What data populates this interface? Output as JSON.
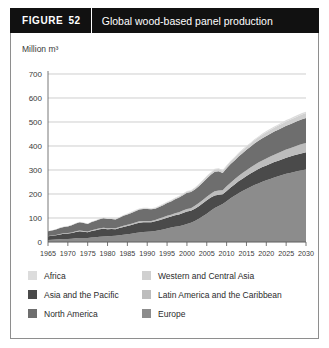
{
  "header": {
    "figure_label": "FIGURE",
    "figure_number": "52",
    "title": "Global wood-based panel production"
  },
  "chart_data": {
    "type": "area",
    "stacked": true,
    "title": "Global wood-based panel production",
    "xlabel": "",
    "ylabel": "Million m³",
    "unit_label": "Million m³",
    "xlim": [
      1965,
      2030
    ],
    "ylim": [
      0,
      700
    ],
    "yticks": [
      0,
      100,
      200,
      300,
      400,
      500,
      600,
      700
    ],
    "xticks": [
      1965,
      1970,
      1975,
      1980,
      1985,
      1990,
      1995,
      2000,
      2005,
      2010,
      2015,
      2020,
      2025,
      2030
    ],
    "grid": true,
    "legend_position": "bottom",
    "x": [
      1965,
      1966,
      1967,
      1968,
      1969,
      1970,
      1971,
      1972,
      1973,
      1974,
      1975,
      1976,
      1977,
      1978,
      1979,
      1980,
      1981,
      1982,
      1983,
      1984,
      1985,
      1986,
      1987,
      1988,
      1989,
      1990,
      1991,
      1992,
      1993,
      1994,
      1995,
      1996,
      1997,
      1998,
      1999,
      2000,
      2001,
      2002,
      2003,
      2004,
      2005,
      2006,
      2007,
      2008,
      2009,
      2010,
      2011,
      2012,
      2013,
      2014,
      2015,
      2016,
      2017,
      2018,
      2019,
      2020,
      2021,
      2022,
      2023,
      2024,
      2025,
      2026,
      2027,
      2028,
      2029,
      2030
    ],
    "series": [
      {
        "name": "Asia and the Pacific",
        "color": "#8c8c8c",
        "values": [
          8,
          9,
          10,
          11,
          12,
          13,
          14,
          16,
          17,
          17,
          17,
          19,
          20,
          22,
          23,
          24,
          25,
          26,
          28,
          30,
          32,
          34,
          37,
          40,
          42,
          43,
          44,
          46,
          49,
          52,
          56,
          60,
          64,
          66,
          70,
          75,
          80,
          88,
          97,
          107,
          118,
          130,
          142,
          150,
          158,
          170,
          182,
          193,
          203,
          212,
          221,
          229,
          237,
          244,
          251,
          257,
          263,
          269,
          274,
          279,
          284,
          288,
          292,
          296,
          299,
          302
        ]
      },
      {
        "name": "North America",
        "color": "#4a4a4a",
        "values": [
          16,
          17,
          18,
          20,
          22,
          22,
          24,
          26,
          28,
          26,
          24,
          27,
          29,
          31,
          32,
          29,
          29,
          27,
          30,
          33,
          35,
          37,
          39,
          40,
          40,
          39,
          38,
          40,
          42,
          44,
          45,
          46,
          47,
          49,
          51,
          52,
          50,
          51,
          52,
          54,
          56,
          55,
          52,
          47,
          41,
          43,
          45,
          47,
          50,
          52,
          54,
          56,
          58,
          60,
          61,
          62,
          63,
          64,
          65,
          66,
          67,
          68,
          69,
          70,
          71,
          72
        ]
      },
      {
        "name": "Latin America and the Caribbean",
        "color": "#bdbdbd",
        "values": [
          1,
          1,
          1,
          2,
          2,
          2,
          2,
          3,
          3,
          3,
          3,
          3,
          4,
          4,
          4,
          4,
          4,
          4,
          4,
          5,
          5,
          5,
          5,
          6,
          6,
          6,
          6,
          6,
          7,
          7,
          8,
          8,
          9,
          9,
          10,
          11,
          11,
          12,
          13,
          14,
          15,
          16,
          17,
          18,
          17,
          19,
          20,
          21,
          22,
          23,
          24,
          25,
          26,
          27,
          28,
          29,
          30,
          31,
          32,
          33,
          34,
          35,
          36,
          37,
          38,
          39
        ]
      },
      {
        "name": "Europe",
        "color": "#6e6e6e",
        "values": [
          20,
          21,
          23,
          25,
          27,
          28,
          30,
          32,
          34,
          33,
          31,
          34,
          36,
          38,
          40,
          39,
          38,
          37,
          39,
          41,
          43,
          45,
          47,
          49,
          50,
          50,
          48,
          47,
          48,
          50,
          53,
          55,
          58,
          61,
          64,
          67,
          67,
          68,
          70,
          73,
          76,
          79,
          82,
          80,
          72,
          75,
          78,
          79,
          81,
          83,
          85,
          87,
          89,
          91,
          92,
          94,
          95,
          96,
          97,
          98,
          99,
          100,
          101,
          102,
          103,
          104
        ]
      },
      {
        "name": "Western and Central Asia",
        "color": "#d0d0d0",
        "values": [
          0,
          0,
          0,
          1,
          1,
          1,
          1,
          1,
          1,
          1,
          1,
          1,
          1,
          2,
          2,
          2,
          2,
          2,
          2,
          2,
          2,
          3,
          3,
          3,
          3,
          3,
          3,
          3,
          3,
          4,
          4,
          4,
          4,
          5,
          5,
          5,
          6,
          6,
          7,
          7,
          8,
          8,
          9,
          9,
          9,
          10,
          11,
          11,
          12,
          12,
          13,
          13,
          14,
          14,
          15,
          15,
          16,
          16,
          17,
          17,
          18,
          18,
          19,
          19,
          20,
          20
        ]
      },
      {
        "name": "Africa",
        "color": "#dcdcdc",
        "values": [
          1,
          1,
          1,
          1,
          1,
          1,
          1,
          1,
          1,
          1,
          1,
          1,
          1,
          1,
          1,
          1,
          1,
          1,
          1,
          2,
          2,
          2,
          2,
          2,
          2,
          2,
          2,
          2,
          2,
          2,
          2,
          2,
          2,
          2,
          2,
          2,
          2,
          2,
          3,
          3,
          3,
          3,
          3,
          3,
          3,
          3,
          3,
          3,
          4,
          4,
          4,
          4,
          4,
          4,
          5,
          5,
          5,
          5,
          5,
          6,
          6,
          6,
          6,
          6,
          6,
          6
        ]
      }
    ]
  },
  "legend": {
    "columns": [
      {
        "items": [
          {
            "label": "Africa",
            "color": "#dcdcdc"
          },
          {
            "label": "Asia and the Pacific",
            "color": "#4a4a4a"
          },
          {
            "label": "North America",
            "color": "#6e6e6e"
          }
        ]
      },
      {
        "items": [
          {
            "label": "Western and Central Asia",
            "color": "#d0d0d0"
          },
          {
            "label": "Latin America and the Caribbean",
            "color": "#bdbdbd"
          },
          {
            "label": "Europe",
            "color": "#8c8c8c"
          }
        ]
      }
    ]
  }
}
